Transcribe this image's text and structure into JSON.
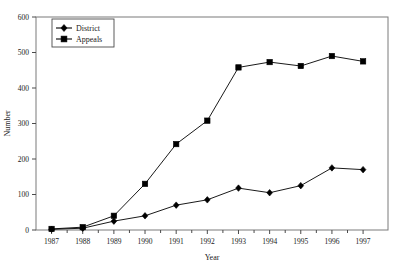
{
  "chart_data": {
    "type": "line",
    "title": "",
    "xlabel": "Year",
    "ylabel": "Number",
    "categories": [
      "1987",
      "1988",
      "1989",
      "1990",
      "1991",
      "1992",
      "1993",
      "1994",
      "1995",
      "1996",
      "1997"
    ],
    "x": [
      1987,
      1988,
      1989,
      1990,
      1991,
      1992,
      1993,
      1994,
      1995,
      1996,
      1997
    ],
    "series": [
      {
        "name": "District",
        "marker": "diamond",
        "color": "#000000",
        "values": [
          2,
          5,
          25,
          40,
          70,
          85,
          118,
          105,
          125,
          175,
          170
        ]
      },
      {
        "name": "Appeals",
        "marker": "square",
        "color": "#000000",
        "values": [
          3,
          8,
          40,
          130,
          242,
          308,
          458,
          473,
          462,
          490,
          475
        ]
      }
    ],
    "ylim": [
      0,
      600
    ],
    "yticks": [
      0,
      100,
      200,
      300,
      400,
      500,
      600
    ],
    "ytick_labels": [
      "0",
      "100",
      "200",
      "300",
      "400",
      "500",
      "600"
    ],
    "xlim": [
      1986.5,
      1997.8
    ],
    "grid": false,
    "legend_position": "top-left",
    "frame": true
  },
  "legend": {
    "entries": [
      {
        "label": "District",
        "marker": "diamond"
      },
      {
        "label": "Appeals",
        "marker": "square"
      }
    ]
  },
  "axes": {
    "y_title": "Number",
    "x_title": "Year"
  }
}
